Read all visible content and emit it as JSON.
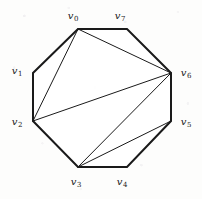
{
  "figure": {
    "width": 202,
    "height": 199,
    "background_color": "#fdfdfc",
    "stroke_color": "#1a1a1a",
    "outline_width": 2,
    "chord_width": 1
  },
  "labels": {
    "v0": {
      "text": "v",
      "sub": "0",
      "x": 73,
      "y": 16
    },
    "v1": {
      "text": "v",
      "sub": "1",
      "x": 17,
      "y": 71
    },
    "v2": {
      "text": "v",
      "sub": "2",
      "x": 17,
      "y": 122
    },
    "v3": {
      "text": "v",
      "sub": "3",
      "x": 76,
      "y": 182
    },
    "v4": {
      "text": "v",
      "sub": "4",
      "x": 122,
      "y": 182
    },
    "v5": {
      "text": "v",
      "sub": "5",
      "x": 186,
      "y": 122
    },
    "v6": {
      "text": "v",
      "sub": "6",
      "x": 186,
      "y": 73
    },
    "v7": {
      "text": "v",
      "sub": "7",
      "x": 120,
      "y": 16
    }
  },
  "graph": {
    "vertices": [
      {
        "id": "v0",
        "x": 78,
        "y": 29
      },
      {
        "id": "v1",
        "x": 33,
        "y": 73
      },
      {
        "id": "v2",
        "x": 33,
        "y": 121
      },
      {
        "id": "v3",
        "x": 78,
        "y": 167
      },
      {
        "id": "v4",
        "x": 127,
        "y": 167
      },
      {
        "id": "v5",
        "x": 171,
        "y": 121
      },
      {
        "id": "v6",
        "x": 171,
        "y": 73
      },
      {
        "id": "v7",
        "x": 127,
        "y": 29
      }
    ],
    "outline_points": "78,29 127,29 171,73 171,121 127,167 78,167 33,121 33,73",
    "chords": [
      {
        "from": "v0",
        "to": "v2"
      },
      {
        "from": "v0",
        "to": "v6"
      },
      {
        "from": "v2",
        "to": "v6"
      },
      {
        "from": "v2",
        "to": "v3"
      },
      {
        "from": "v3",
        "to": "v6"
      },
      {
        "from": "v3",
        "to": "v5"
      }
    ]
  }
}
